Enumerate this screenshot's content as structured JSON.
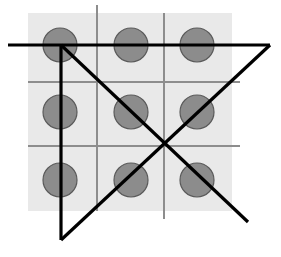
{
  "figure": {
    "canvas": {
      "width": 281,
      "height": 257,
      "background": "#ffffff"
    },
    "panel": {
      "name": "gray-backing-square",
      "x": 28,
      "y": 13,
      "width": 204,
      "height": 198,
      "fill": "#e9e9e9"
    },
    "grid": {
      "stroke": "#8d8d8d",
      "stroke_width": 1.4,
      "vertical_lines": [
        {
          "x": 97,
          "y1": 5,
          "y2": 211
        },
        {
          "x": 164,
          "y1": 13,
          "y2": 219
        }
      ],
      "horizontal_lines": [
        {
          "y": 82,
          "x1": 28,
          "x2": 240
        },
        {
          "y": 146,
          "x1": 28,
          "x2": 240
        }
      ]
    },
    "dots": {
      "radius": 17,
      "fill": "#8c8c8c",
      "stroke": "#5a5a5a",
      "stroke_width": 1.2,
      "count": 9,
      "columns_x": [
        60,
        131,
        197
      ],
      "rows_y": [
        45,
        112,
        180
      ],
      "points": [
        {
          "id": "dot-r1c1",
          "cx": 60,
          "cy": 45
        },
        {
          "id": "dot-r1c2",
          "cx": 131,
          "cy": 45
        },
        {
          "id": "dot-r1c3",
          "cx": 197,
          "cy": 45
        },
        {
          "id": "dot-r2c1",
          "cx": 60,
          "cy": 112
        },
        {
          "id": "dot-r2c2",
          "cx": 131,
          "cy": 112
        },
        {
          "id": "dot-r2c3",
          "cx": 197,
          "cy": 112
        },
        {
          "id": "dot-r3c1",
          "cx": 60,
          "cy": 180
        },
        {
          "id": "dot-r3c2",
          "cx": 131,
          "cy": 180
        },
        {
          "id": "dot-r3c3",
          "cx": 197,
          "cy": 180
        }
      ]
    },
    "solution_path": {
      "stroke": "#000000",
      "stroke_width": 3.2,
      "segments": [
        {
          "id": "segment-1-horizontal-top",
          "x1": 8,
          "y1": 45,
          "x2": 270,
          "y2": 45
        },
        {
          "id": "segment-2-diagonal-down-right",
          "x1": 61,
          "y1": 45,
          "x2": 248,
          "y2": 222
        },
        {
          "id": "segment-3-vertical-left",
          "x1": 61,
          "y1": 45,
          "x2": 61,
          "y2": 240
        },
        {
          "id": "segment-4-diagonal-up-right",
          "x1": 61,
          "y1": 240,
          "x2": 270,
          "y2": 45
        }
      ]
    }
  }
}
